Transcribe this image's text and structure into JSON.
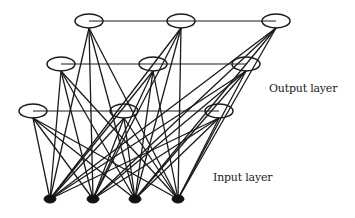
{
  "diagram": {
    "type": "neural-network",
    "labels": {
      "output": "Output layer",
      "input": "Input layer"
    },
    "colors": {
      "line": "#1a1a1a",
      "output_node_fill": "#ffffff",
      "input_node_fill": "#111111",
      "background": "#ffffff"
    },
    "output_layer": {
      "rows": [
        [
          {
            "x": 89,
            "y": 21
          },
          {
            "x": 181,
            "y": 21
          },
          {
            "x": 276,
            "y": 21
          }
        ],
        [
          {
            "x": 61,
            "y": 64
          },
          {
            "x": 153,
            "y": 64
          },
          {
            "x": 246,
            "y": 64
          }
        ],
        [
          {
            "x": 33,
            "y": 111
          },
          {
            "x": 124,
            "y": 111
          },
          {
            "x": 219,
            "y": 111
          }
        ]
      ],
      "node_rx": 14,
      "node_ry": 7
    },
    "input_layer": {
      "nodes": [
        {
          "x": 50,
          "y": 199
        },
        {
          "x": 93,
          "y": 199
        },
        {
          "x": 135,
          "y": 199
        },
        {
          "x": 178,
          "y": 199
        }
      ],
      "node_rx": 6,
      "node_ry": 4
    },
    "connections": "each output node connects to every input node; nodes in each output row are joined by a horizontal line"
  }
}
